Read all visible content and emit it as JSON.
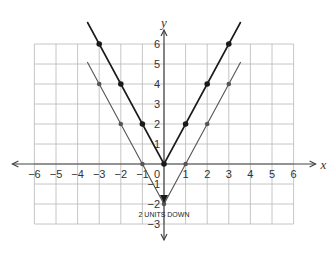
{
  "chart_data": {
    "type": "line",
    "title": "",
    "xlabel": "x",
    "ylabel": "y",
    "xlim": [
      -6,
      6
    ],
    "ylim": [
      -3,
      6
    ],
    "x_ticks": [
      "-6",
      "-5",
      "-4",
      "-3",
      "-2",
      "-1",
      "1",
      "2",
      "3",
      "4",
      "5",
      "6"
    ],
    "y_ticks": [
      "-3",
      "-2",
      "-1",
      "1",
      "2",
      "3",
      "4",
      "5",
      "6"
    ],
    "origin_label": "0",
    "grid": true,
    "series": [
      {
        "name": "y = 2|x|",
        "style": "dark",
        "points": [
          [
            -3,
            6
          ],
          [
            -2,
            4
          ],
          [
            -1,
            2
          ],
          [
            0,
            0
          ],
          [
            1,
            2
          ],
          [
            2,
            4
          ],
          [
            3,
            6
          ]
        ]
      },
      {
        "name": "y = 2|x| - 2",
        "style": "light",
        "points": [
          [
            -3,
            4
          ],
          [
            -2,
            2
          ],
          [
            -1,
            0
          ],
          [
            0,
            -2
          ],
          [
            1,
            0
          ],
          [
            2,
            2
          ],
          [
            3,
            4
          ]
        ]
      }
    ],
    "annotations": [
      {
        "text": "2 UNITS DOWN",
        "x": 0,
        "y": -2.5,
        "arrow_from": [
          0,
          0
        ],
        "arrow_to": [
          0,
          -2
        ]
      }
    ]
  }
}
